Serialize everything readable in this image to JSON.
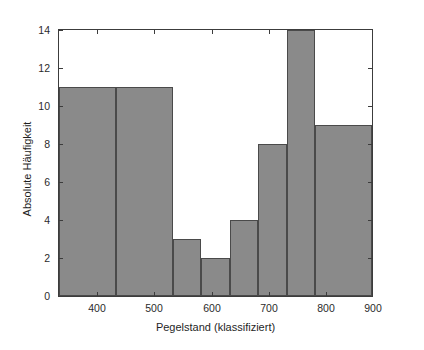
{
  "chart_data": {
    "type": "bar",
    "title": "",
    "subtitle": "",
    "xlabel": "Pegelstand (klassifiziert)",
    "ylabel": "Absolute Häufigkeit",
    "xlim": [
      350,
      900
    ],
    "ylim": [
      0,
      14
    ],
    "grid": false,
    "legend": null,
    "bar_color": "#8a8a8a",
    "bar_edge_color": "#4a4a4a",
    "axis_color": "#3c3c3c",
    "background_color": "#ffffff",
    "histogram": true,
    "bin_edges": [
      350,
      450,
      550,
      600,
      650,
      700,
      750,
      800,
      900
    ],
    "categories": [
      "350-450",
      "450-550",
      "550-600",
      "600-650",
      "650-700",
      "700-750",
      "750-800",
      "800-900"
    ],
    "values": [
      11,
      11,
      3,
      2,
      4,
      8,
      14,
      9
    ],
    "bars": [
      {
        "label": "350-450",
        "x0": 350,
        "x1": 450,
        "value": 11
      },
      {
        "label": "450-550",
        "x0": 450,
        "x1": 550,
        "value": 11
      },
      {
        "label": "550-600",
        "x0": 550,
        "x1": 600,
        "value": 3
      },
      {
        "label": "600-650",
        "x0": 600,
        "x1": 650,
        "value": 2
      },
      {
        "label": "650-700",
        "x0": 650,
        "x1": 700,
        "value": 4
      },
      {
        "label": "700-750",
        "x0": 700,
        "x1": 750,
        "value": 8
      },
      {
        "label": "750-800",
        "x0": 750,
        "x1": 800,
        "value": 14
      },
      {
        "label": "800-900",
        "x0": 800,
        "x1": 900,
        "value": 9
      }
    ],
    "x_ticks": [
      400,
      500,
      600,
      700,
      800,
      900
    ],
    "x_tick_labels": [
      "400",
      "500",
      "600",
      "700",
      "800",
      "900"
    ],
    "y_ticks": [
      0,
      2,
      4,
      6,
      8,
      10,
      12,
      14
    ],
    "y_tick_labels": [
      "0",
      "2",
      "4",
      "6",
      "8",
      "10",
      "12",
      "14"
    ]
  }
}
